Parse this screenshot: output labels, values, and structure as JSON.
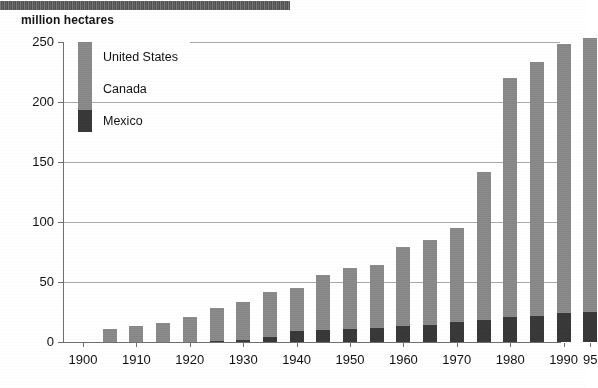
{
  "unit_label": "million hectares",
  "legend": {
    "items": [
      {
        "label": "United States",
        "color": "#8d8d8d"
      },
      {
        "label": "Canada",
        "color": "#8d8d8d"
      },
      {
        "label": "Mexico",
        "color": "#3a3a3a"
      }
    ]
  },
  "axes": {
    "y_ticks": [
      "250",
      "200",
      "150",
      "100",
      "50",
      "0"
    ],
    "x_ticks": [
      "1900",
      "1910",
      "1920",
      "1930",
      "1940",
      "1950",
      "1960",
      "1970",
      "1980",
      "1990",
      "95"
    ]
  },
  "chart_data": {
    "type": "bar",
    "stacked": true,
    "title": "",
    "subtitle": "",
    "xlabel": "",
    "ylabel": "million hectares",
    "ylim": [
      0,
      250
    ],
    "grid": true,
    "legend_position": "upper-left-inside",
    "categories": [
      "1905",
      "1910",
      "1915",
      "1920",
      "1925",
      "1930",
      "1935",
      "1940",
      "1945",
      "1950",
      "1955",
      "1960",
      "1965",
      "1970",
      "1975",
      "1980",
      "1985",
      "1990",
      "1995"
    ],
    "series": [
      {
        "name": "Mexico",
        "color": "#3a3a3a",
        "values": [
          0,
          0,
          0,
          0,
          1,
          2,
          4,
          9,
          10,
          11,
          12,
          13,
          14,
          17,
          18,
          21,
          22,
          24,
          25
        ]
      },
      {
        "name": "Canada",
        "color": "#8d8d8d",
        "values": [
          0,
          0,
          0,
          0,
          0,
          0,
          0,
          0,
          0,
          0,
          0,
          0,
          0,
          0,
          0,
          0,
          0,
          0,
          0
        ]
      },
      {
        "name": "United States",
        "color": "#8d8d8d",
        "values": [
          11,
          13,
          16,
          21,
          27,
          31,
          38,
          36,
          46,
          51,
          52,
          66,
          71,
          78,
          124,
          199,
          211,
          224,
          228
        ]
      }
    ],
    "totals": [
      11,
      13,
      16,
      21,
      28,
      33,
      42,
      45,
      56,
      62,
      64,
      79,
      85,
      95,
      142,
      220,
      233,
      248,
      253
    ]
  }
}
